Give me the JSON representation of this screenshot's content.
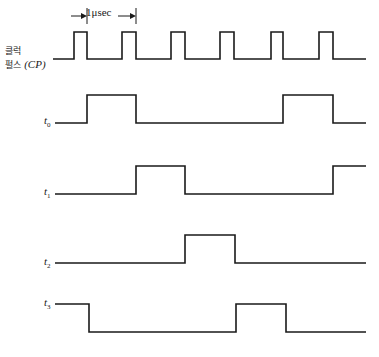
{
  "diagram": {
    "period_annotation": "1μsec",
    "clock_label_line1": "클럭",
    "clock_label_line2": "펄스",
    "clock_label_abbr": "(CP)",
    "signals": [
      {
        "name": "t",
        "sub": "0"
      },
      {
        "name": "t",
        "sub": "1"
      },
      {
        "name": "t",
        "sub": "2"
      },
      {
        "name": "t",
        "sub": "3"
      }
    ],
    "line_color": "#1a1a1a"
  },
  "chart_data": {
    "type": "timing-diagram",
    "period": "1 μsec",
    "x_unit": "pixels",
    "clock": {
      "label": "클럭 펄스 (CP)",
      "pulses": [
        [
          74,
          87
        ],
        [
          122,
          136
        ],
        [
          171,
          185
        ],
        [
          220,
          234
        ],
        [
          271,
          283
        ],
        [
          319,
          333
        ]
      ],
      "start_x": 53,
      "end_x": 366,
      "high_y": 32,
      "low_y": 59
    },
    "signals": [
      {
        "label": "t0",
        "high_intervals": [
          [
            87,
            136
          ],
          [
            283,
            333
          ]
        ],
        "start_x": 55,
        "end_x": 366,
        "high_y": 95,
        "low_y": 123
      },
      {
        "label": "t1",
        "high_intervals": [
          [
            136,
            185
          ],
          [
            333,
            366
          ]
        ],
        "start_x": 55,
        "end_x": 366,
        "high_y": 166,
        "low_y": 194
      },
      {
        "label": "t2",
        "high_intervals": [
          [
            185,
            235
          ]
        ],
        "start_x": 55,
        "end_x": 366,
        "high_y": 235,
        "low_y": 263
      },
      {
        "label": "t3",
        "high_intervals": [
          [
            55,
            89
          ],
          [
            236,
            286
          ]
        ],
        "start_x": 55,
        "end_x": 366,
        "high_y": 304,
        "low_y": 332
      }
    ]
  }
}
